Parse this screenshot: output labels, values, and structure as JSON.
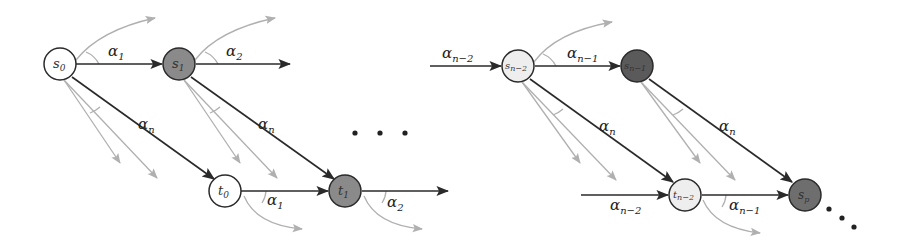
{
  "diagram": {
    "colors": {
      "edge": "#2a2a2a",
      "ghost_edge": "#b0b0b0",
      "node_white": "#ffffff",
      "node_light": "#eeeeee",
      "node_mid": "#8a8a8a",
      "node_dark": "#5a5a5a"
    },
    "nodes": [
      {
        "id": "s0",
        "label": "s",
        "sub": "0",
        "fill": "white"
      },
      {
        "id": "s1",
        "label": "s",
        "sub": "1",
        "fill": "mid"
      },
      {
        "id": "t0",
        "label": "t",
        "sub": "0",
        "fill": "white"
      },
      {
        "id": "t1",
        "label": "t",
        "sub": "1",
        "fill": "mid"
      },
      {
        "id": "sn2",
        "label": "s",
        "sub": "n−2",
        "fill": "light"
      },
      {
        "id": "sn1",
        "label": "s",
        "sub": "n−1",
        "fill": "dark"
      },
      {
        "id": "tn2",
        "label": "t",
        "sub": "n−2",
        "fill": "light"
      },
      {
        "id": "sp",
        "label": "s",
        "sub": "p",
        "fill": "mid"
      }
    ],
    "edge_labels": {
      "a1": {
        "base": "α",
        "sub": "1"
      },
      "a2": {
        "base": "α",
        "sub": "2"
      },
      "an": {
        "base": "α",
        "sub": "n"
      },
      "an2": {
        "base": "α",
        "sub": "n−2"
      },
      "an1": {
        "base": "α",
        "sub": "n−1"
      }
    },
    "ellipsis": "• • •"
  }
}
